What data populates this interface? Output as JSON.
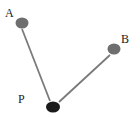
{
  "diagram": {
    "nodes": [
      {
        "id": "A",
        "label": "A",
        "cx": 22,
        "cy": 23,
        "rx": 6.5,
        "ry": 5.5,
        "fill": "#6e6e6e",
        "label_x": 5,
        "label_y": 17
      },
      {
        "id": "B",
        "label": "B",
        "cx": 114,
        "cy": 49,
        "rx": 6.5,
        "ry": 5.5,
        "fill": "#6e6e6e",
        "label_x": 121,
        "label_y": 43
      },
      {
        "id": "P",
        "label": "P",
        "cx": 53,
        "cy": 107,
        "rx": 7,
        "ry": 5.5,
        "fill": "#1a1a1a",
        "label_x": 18,
        "label_y": 103
      }
    ],
    "edges": [
      {
        "from": "A",
        "to": "P",
        "x1": 22,
        "y1": 29,
        "x2": 50,
        "y2": 101,
        "stroke": "#7a7a7a"
      },
      {
        "from": "B",
        "to": "P",
        "x1": 110,
        "y1": 55,
        "x2": 59,
        "y2": 102,
        "stroke": "#7a7a7a"
      }
    ]
  }
}
